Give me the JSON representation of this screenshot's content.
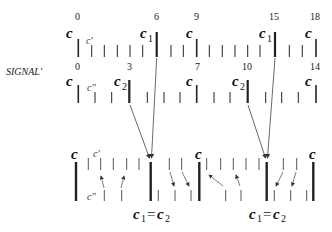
{
  "diagram": {
    "signal_label": "SIGNAL'",
    "row1": {
      "numbers": [
        {
          "text": "0",
          "x": 78
        },
        {
          "text": "6",
          "x": 157
        },
        {
          "text": "9",
          "x": 197
        },
        {
          "text": "15",
          "x": 275
        },
        {
          "text": "18",
          "x": 316
        }
      ],
      "labels": [
        {
          "text": "c",
          "sub": "",
          "x": 66,
          "y": 38
        },
        {
          "text": "c'",
          "sub": "",
          "x": 87,
          "y": 44,
          "small": true
        },
        {
          "text": "c",
          "sub": "1",
          "x": 140,
          "y": 38
        },
        {
          "text": "c",
          "sub": "",
          "x": 185,
          "y": 38
        },
        {
          "text": "c",
          "sub": "1",
          "x": 258,
          "y": 38
        },
        {
          "text": "c",
          "sub": "",
          "x": 305,
          "y": 38
        }
      ]
    },
    "row2": {
      "numbers": [
        {
          "text": "0",
          "x": 78
        },
        {
          "text": "3",
          "x": 129
        },
        {
          "text": "7",
          "x": 197
        },
        {
          "text": "10",
          "x": 248
        },
        {
          "text": "14",
          "x": 316
        }
      ],
      "labels": [
        {
          "text": "c",
          "sub": "",
          "x": 66,
          "y": 85
        },
        {
          "text": "c''",
          "sub": "",
          "x": 88,
          "y": 90,
          "small": true
        },
        {
          "text": "c",
          "sub": "2",
          "x": 113,
          "y": 85
        },
        {
          "text": "c",
          "sub": "",
          "x": 185,
          "y": 85
        },
        {
          "text": "c",
          "sub": "2",
          "x": 231,
          "y": 85
        },
        {
          "text": "c",
          "sub": "",
          "x": 305,
          "y": 85
        }
      ]
    },
    "row3": {
      "labels": [
        {
          "text": "c",
          "x": 71,
          "y": 160
        },
        {
          "text": "c'",
          "x": 93,
          "y": 157,
          "small": true
        },
        {
          "text": "c''",
          "x": 87,
          "y": 200,
          "small": true
        },
        {
          "text": "c",
          "x": 194,
          "y": 160
        },
        {
          "text": "c",
          "x": 308,
          "y": 160
        }
      ],
      "equations": [
        {
          "c": "c",
          "sub1": "1",
          "eq": "=",
          "sub2": "2",
          "x": 133
        },
        {
          "c": "c",
          "sub1": "1",
          "eq": "=",
          "sub2": "2",
          "x": 249
        }
      ]
    }
  }
}
